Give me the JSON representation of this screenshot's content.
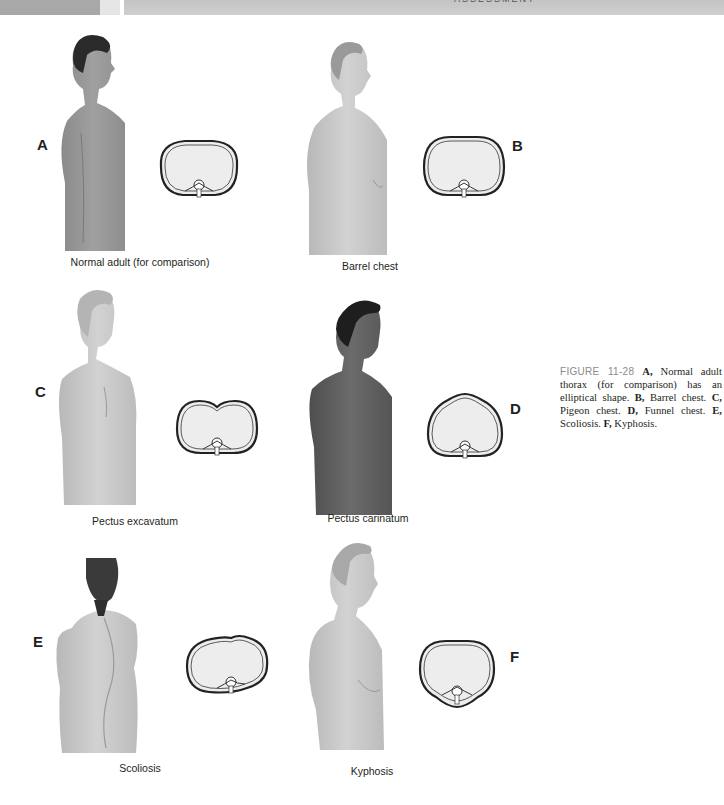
{
  "header": {
    "running_title": "ASSESSMENT"
  },
  "panels": [
    {
      "letter": "A",
      "label": "Normal adult (for comparison)",
      "figure": "side-profile-normal-adult-male",
      "cross_section": "elliptical-thorax"
    },
    {
      "letter": "B",
      "label": "Barrel chest",
      "figure": "side-profile-barrel-chest-male",
      "cross_section": "rounded-thorax"
    },
    {
      "letter": "C",
      "label": "Pectus excavatum",
      "figure": "front-view-young-male",
      "cross_section": "indented-sternum-thorax"
    },
    {
      "letter": "D",
      "label": "Pectus carinatum",
      "figure": "front-view-dark-skinned-male",
      "cross_section": "protruding-sternum-thorax"
    },
    {
      "letter": "E",
      "label": "Scoliosis",
      "figure": "back-view-female-curved-spine",
      "cross_section": "asymmetric-thorax"
    },
    {
      "letter": "F",
      "label": "Kyphosis",
      "figure": "side-profile-elderly-male-hunched",
      "cross_section": "rounded-kyphotic-thorax"
    }
  ],
  "caption": {
    "figure_number": "FIGURE 11-28",
    "parts": [
      {
        "key": "A,",
        "text": " Normal adult thorax (for comparison) has an elliptical shape. "
      },
      {
        "key": "B,",
        "text": " Barrel chest. "
      },
      {
        "key": "C,",
        "text": " Pigeon chest. "
      },
      {
        "key": "D,",
        "text": " Funnel chest. "
      },
      {
        "key": "E,",
        "text": " Scoliosis. "
      },
      {
        "key": "F,",
        "text": " Kyphosis."
      }
    ]
  },
  "colors": {
    "header_band": "#c8c8c8",
    "figure_label_gray": "#8a8a8a",
    "cross_section_fill": "#ededed",
    "skin_light": "#c9c9c9",
    "skin_dark": "#6e6e6e"
  }
}
